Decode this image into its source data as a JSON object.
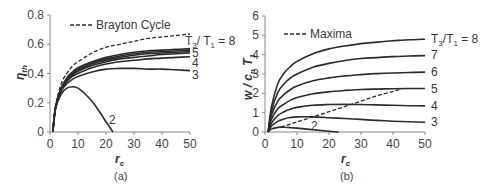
{
  "chart_data": [
    {
      "panel": "(a)",
      "type": "line",
      "title": "",
      "xlabel": "r_c",
      "ylabel": "η_th",
      "xlim": [
        0,
        50
      ],
      "ylim": [
        0,
        0.8
      ],
      "xticks": [
        0,
        10,
        20,
        30,
        40,
        50
      ],
      "yticks": [
        0,
        0.2,
        0.4,
        0.6,
        0.8
      ],
      "ytick_labels": [
        "0",
        "0.2",
        "0.4",
        "0.6",
        "0.8"
      ],
      "legend": [
        "Brayton Cycle"
      ],
      "legend_position": "top-left",
      "grid": false,
      "x": [
        1,
        2,
        4,
        6,
        8,
        10,
        15,
        20,
        25,
        30,
        35,
        40,
        45,
        50
      ],
      "series": [
        {
          "name": "Brayton Cycle",
          "style": "dashed",
          "values": [
            0,
            0.18,
            0.33,
            0.4,
            0.45,
            0.48,
            0.54,
            0.58,
            0.6,
            0.62,
            0.64,
            0.65,
            0.66,
            0.67
          ]
        },
        {
          "name": "T3/T1 = 8",
          "style": "solid",
          "values": [
            0,
            0.17,
            0.3,
            0.37,
            0.41,
            0.44,
            0.48,
            0.51,
            0.53,
            0.545,
            0.555,
            0.56,
            0.565,
            0.57
          ]
        },
        {
          "name": "T3/T1 = 7",
          "style": "solid",
          "values": [
            0,
            0.17,
            0.3,
            0.36,
            0.4,
            0.43,
            0.475,
            0.5,
            0.52,
            0.535,
            0.545,
            0.55,
            0.555,
            0.56
          ]
        },
        {
          "name": "T3/T1 = 6",
          "style": "solid",
          "values": [
            0,
            0.17,
            0.29,
            0.355,
            0.395,
            0.42,
            0.465,
            0.49,
            0.51,
            0.525,
            0.535,
            0.54,
            0.545,
            0.55
          ]
        },
        {
          "name": "T3/T1 = 5",
          "style": "solid",
          "values": [
            0,
            0.17,
            0.29,
            0.35,
            0.39,
            0.415,
            0.455,
            0.48,
            0.5,
            0.51,
            0.52,
            0.53,
            0.535,
            0.54
          ]
        },
        {
          "name": "T3/T1 = 4",
          "style": "solid",
          "values": [
            0,
            0.17,
            0.29,
            0.345,
            0.38,
            0.4,
            0.44,
            0.465,
            0.48,
            0.49,
            0.5,
            0.505,
            0.51,
            0.515
          ]
        },
        {
          "name": "T3/T1 = 3",
          "style": "solid",
          "values": [
            0,
            0.17,
            0.28,
            0.33,
            0.36,
            0.38,
            0.41,
            0.43,
            0.435,
            0.435,
            0.43,
            0.43,
            0.425,
            0.42
          ]
        },
        {
          "name": "T3/T1 = 2",
          "style": "solid",
          "x": [
            1,
            2,
            4,
            6,
            8,
            10,
            12,
            15,
            18,
            20,
            22.5
          ],
          "values": [
            0,
            0.16,
            0.26,
            0.3,
            0.31,
            0.3,
            0.27,
            0.21,
            0.13,
            0.07,
            0
          ]
        }
      ],
      "annotations": [
        "T3/T1 = 8",
        "5",
        "4",
        "3",
        "2"
      ]
    },
    {
      "panel": "(b)",
      "type": "line",
      "title": "",
      "xlabel": "r_c",
      "ylabel": "w / c_p T_1",
      "xlim": [
        0,
        50
      ],
      "ylim": [
        0,
        6
      ],
      "xticks": [
        0,
        10,
        20,
        30,
        40,
        50
      ],
      "yticks": [
        0,
        1,
        2,
        3,
        4,
        5,
        6
      ],
      "legend": [
        "Maxima"
      ],
      "legend_position": "top-left",
      "grid": false,
      "x": [
        1,
        2,
        4,
        6,
        8,
        10,
        15,
        20,
        25,
        30,
        35,
        40,
        45,
        50
      ],
      "series": [
        {
          "name": "T3/T1 = 8",
          "style": "solid",
          "values": [
            0,
            1.3,
            2.5,
            3.05,
            3.4,
            3.65,
            4.05,
            4.3,
            4.45,
            4.57,
            4.65,
            4.72,
            4.77,
            4.8
          ]
        },
        {
          "name": "T3/T1 = 7",
          "style": "solid",
          "values": [
            0,
            1.05,
            2.05,
            2.5,
            2.8,
            3.0,
            3.35,
            3.55,
            3.7,
            3.8,
            3.85,
            3.9,
            3.93,
            3.95
          ]
        },
        {
          "name": "T3/T1 = 6",
          "style": "solid",
          "values": [
            0,
            0.85,
            1.6,
            1.95,
            2.2,
            2.38,
            2.65,
            2.8,
            2.9,
            2.97,
            3.02,
            3.05,
            3.08,
            3.1
          ]
        },
        {
          "name": "T3/T1 = 5",
          "style": "solid",
          "values": [
            0,
            0.65,
            1.2,
            1.45,
            1.65,
            1.78,
            1.98,
            2.08,
            2.15,
            2.2,
            2.22,
            2.24,
            2.25,
            2.25
          ]
        },
        {
          "name": "T3/T1 = 4",
          "style": "solid",
          "values": [
            0,
            0.45,
            0.85,
            1.05,
            1.18,
            1.27,
            1.38,
            1.42,
            1.43,
            1.42,
            1.4,
            1.38,
            1.36,
            1.35
          ]
        },
        {
          "name": "T3/T1 = 3",
          "style": "solid",
          "values": [
            0,
            0.3,
            0.55,
            0.68,
            0.75,
            0.78,
            0.78,
            0.74,
            0.7,
            0.65,
            0.6,
            0.56,
            0.53,
            0.5
          ]
        },
        {
          "name": "T3/T1 = 2",
          "style": "solid",
          "x": [
            1,
            2,
            4,
            6,
            8,
            10,
            15,
            20,
            23
          ],
          "values": [
            0,
            0.15,
            0.24,
            0.25,
            0.23,
            0.2,
            0.12,
            0.04,
            0
          ]
        },
        {
          "name": "Maxima",
          "style": "dashed",
          "x": [
            5,
            10,
            15,
            20,
            25,
            30,
            35,
            40,
            43
          ],
          "values": [
            0.25,
            0.52,
            0.78,
            1.05,
            1.32,
            1.6,
            1.87,
            2.1,
            2.25
          ]
        }
      ],
      "annotations": [
        "T3/T1 = 8",
        "7",
        "6",
        "5",
        "4",
        "3",
        "2"
      ]
    }
  ],
  "panels": {
    "a": {
      "caption": "(a)",
      "xlabel": "r",
      "xlabel_sub": "c",
      "ylabel": "η",
      "ylabel_sub": "th",
      "legend_label": "Brayton Cycle",
      "xticks": [
        "0",
        "10",
        "20",
        "30",
        "40",
        "50"
      ],
      "yticks": [
        "0",
        "0.2",
        "0.4",
        "0.6",
        "0.8"
      ],
      "curve_labels": {
        "top": "T",
        "top_sub1": "3",
        "top_mid": "/ T",
        "top_sub2": "1",
        "top_end": " = 8",
        "l5": "5",
        "l4": "4",
        "l3": "3",
        "l2": "2"
      }
    },
    "b": {
      "caption": "(b)",
      "xlabel": "r",
      "xlabel_sub": "c",
      "ylabel": "w / c",
      "ylabel_sub1": "p",
      "ylabel_mid": " T",
      "ylabel_sub2": "1",
      "legend_label": "Maxima",
      "xticks": [
        "0",
        "10",
        "20",
        "30",
        "40",
        "50"
      ],
      "yticks": [
        "0",
        "1",
        "2",
        "3",
        "4",
        "5",
        "6"
      ],
      "curve_labels": {
        "top": "T",
        "top_sub1": "3",
        "top_mid": "/T",
        "top_sub2": "1",
        "top_end": " = 8",
        "l7": "7",
        "l6": "6",
        "l5": "5",
        "l4": "4",
        "l3": "3",
        "l2": "2"
      }
    }
  }
}
